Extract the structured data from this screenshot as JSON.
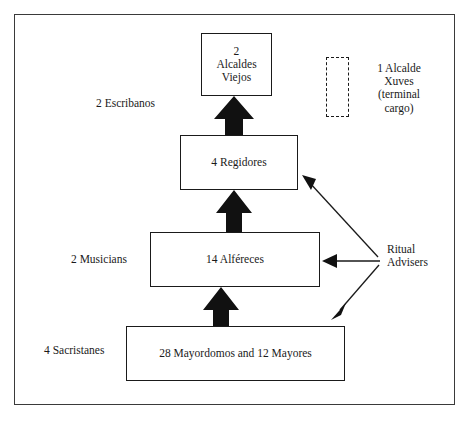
{
  "diagram": {
    "frame": {
      "border_color": "#3a3a3a"
    },
    "nodes": [
      {
        "id": "alcaldes",
        "label": "2\nAlcaldes\nViejos",
        "count": 2,
        "role": "Alcaldes Viejos",
        "rank": 1,
        "style": "solid"
      },
      {
        "id": "regidores",
        "label": "4 Regidores",
        "count": 4,
        "role": "Regidores",
        "rank": 2,
        "style": "solid"
      },
      {
        "id": "alfereces",
        "label": "14 Alféreces",
        "count": 14,
        "role": "Alféreces",
        "rank": 3,
        "style": "solid"
      },
      {
        "id": "mayordomos",
        "label": "28 Mayordomos and 12 Mayores",
        "count": 40,
        "role": "Mayordomos and Mayores",
        "rank": 4,
        "style": "solid"
      },
      {
        "id": "xuves",
        "label": "",
        "role": "Alcalde Xuves",
        "style": "dashed"
      }
    ],
    "side_labels": [
      {
        "id": "escribanos",
        "text": "2 Escribanos"
      },
      {
        "id": "musicians",
        "text": "2 Musicians"
      },
      {
        "id": "sacristanes",
        "text": "4 Sacristanes"
      },
      {
        "id": "xuves",
        "text": "1 Alcalde\nXuves\n(terminal\ncargo)"
      },
      {
        "id": "advisers",
        "text": "Ritual\nAdvisers"
      }
    ],
    "flow_arrows": [
      {
        "from": "mayordomos",
        "to": "alfereces",
        "style": "thick-block"
      },
      {
        "from": "alfereces",
        "to": "regidores",
        "style": "thick-block"
      },
      {
        "from": "regidores",
        "to": "alcaldes",
        "style": "thick-block"
      }
    ],
    "advisory_arrows": [
      {
        "from": "advisers",
        "to": "regidores",
        "style": "thin-line"
      },
      {
        "from": "advisers",
        "to": "alfereces",
        "style": "thin-line"
      },
      {
        "from": "advisers",
        "to": "mayordomos",
        "style": "thin-line"
      }
    ],
    "colors": {
      "ink": "#1a1a1a",
      "frame": "#3a3a3a",
      "paper": "#ffffff"
    }
  }
}
